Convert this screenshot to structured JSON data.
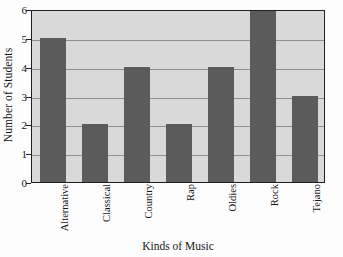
{
  "chart_data": {
    "type": "bar",
    "title": "",
    "xlabel": "Kinds of Music",
    "ylabel": "Number of Students",
    "categories": [
      "Alternative",
      "Classical",
      "Country",
      "Rap",
      "Oldies",
      "Rock",
      "Tejano"
    ],
    "values": [
      5,
      2,
      4,
      2,
      4,
      6,
      3
    ],
    "ylim": [
      0,
      6
    ],
    "ytick_labels": [
      "0",
      "1",
      "2",
      "3",
      "4",
      "5",
      "6"
    ],
    "ytick_values": [
      0,
      1,
      2,
      3,
      4,
      5,
      6
    ],
    "grid": true,
    "grid_axis": "y",
    "legend": "none",
    "colors": {
      "bar_fill": "#5b5b5b",
      "plot_background": "#d9d9d9",
      "gridline": "#8e8e8e",
      "axis_frame": "#1f1f1f",
      "text": "#161616",
      "figure_background": "#fdfdfd"
    }
  }
}
